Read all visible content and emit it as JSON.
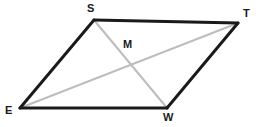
{
  "figure": {
    "kind": "geometry-diagram",
    "shape_name": "parallelogram",
    "width": 260,
    "height": 127,
    "background_color": "#ffffff",
    "side_color": "#1a1a1a",
    "side_width": 3,
    "diagonal_color": "#bdbdbd",
    "diagonal_width": 2,
    "label_color": "#1a1a1a"
  },
  "vertices": {
    "S": {
      "label": "S",
      "x": 94,
      "y": 20,
      "label_x": 87,
      "label_y": 3
    },
    "T": {
      "label": "T",
      "x": 238,
      "y": 23,
      "label_x": 243,
      "label_y": 8
    },
    "E": {
      "label": "E",
      "x": 20,
      "y": 108,
      "label_x": 5,
      "label_y": 105
    },
    "W": {
      "label": "W",
      "x": 167,
      "y": 108,
      "label_x": 163,
      "label_y": 112
    },
    "M": {
      "label": "M",
      "x": 129,
      "y": 64,
      "label_x": 123,
      "label_y": 39
    }
  },
  "sides": [
    {
      "name": "side-ST",
      "from": "S",
      "to": "T"
    },
    {
      "name": "side-TW",
      "from": "T",
      "to": "W"
    },
    {
      "name": "side-WE",
      "from": "W",
      "to": "E"
    },
    {
      "name": "side-ES",
      "from": "E",
      "to": "S"
    }
  ],
  "diagonals": [
    {
      "name": "diagonal-SW",
      "from": "S",
      "to": "W"
    },
    {
      "name": "diagonal-ET",
      "from": "E",
      "to": "T"
    }
  ],
  "labels": {
    "s": "S",
    "t": "T",
    "e": "E",
    "w": "W",
    "m": "M"
  }
}
